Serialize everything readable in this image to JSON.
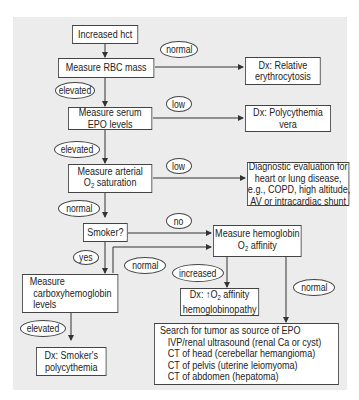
{
  "diagram": {
    "type": "flowchart",
    "nodes": {
      "start": {
        "lines": [
          "Increased hct"
        ]
      },
      "rbc_mass": {
        "lines": [
          "Measure RBC mass"
        ]
      },
      "relative": {
        "lines": [
          "Dx: Relative",
          "erythrocytosis"
        ]
      },
      "epo": {
        "lines": [
          "Measure serum",
          "EPO levels"
        ]
      },
      "pv": {
        "lines": [
          "Dx: Polycythemia",
          "vera"
        ]
      },
      "o2sat": {
        "lines": [
          "Measure arterial",
          "O2 saturation"
        ]
      },
      "diag_eval": {
        "lines": [
          "Diagnostic evaluation for",
          "heart or lung disease,",
          "e.g., COPD, high altitude,",
          "AV or intracardiac shunt"
        ]
      },
      "smoker": {
        "lines": [
          "Smoker?"
        ]
      },
      "hb_affinity": {
        "lines": [
          "Measure hemoglobin",
          "O2 affinity"
        ]
      },
      "cohb": {
        "lines": [
          "Measure",
          "carboxyhemoglobin",
          "levels"
        ]
      },
      "hb_path": {
        "lines": [
          "Dx: ↑O2 affinity",
          "hemoglobinopathy"
        ]
      },
      "smokers_pc": {
        "lines": [
          "Dx: Smoker's",
          "polycythemia"
        ]
      },
      "tumor": {
        "lines": [
          "Search for tumor as source of EPO",
          "IVP/renal ultrasound (renal Ca or cyst)",
          "CT of head (cerebellar hemangioma)",
          "CT of pelvis (uterine leiomyoma)",
          "CT of abdomen (hepatoma)"
        ]
      }
    },
    "edge_labels": {
      "rbc_normal": "normal",
      "rbc_elevated": "elevated",
      "epo_low": "low",
      "epo_elevated": "elevated",
      "o2_low": "low",
      "o2_normal": "normal",
      "smoker_no": "no",
      "smoker_yes": "yes",
      "cohb_normal": "normal",
      "cohb_elevated": "elevated",
      "affinity_increased": "increased",
      "affinity_normal": "normal"
    },
    "edges": [
      {
        "from": "start",
        "to": "rbc_mass"
      },
      {
        "from": "rbc_mass",
        "to": "relative",
        "label": "normal"
      },
      {
        "from": "rbc_mass",
        "to": "epo",
        "label": "elevated"
      },
      {
        "from": "epo",
        "to": "pv",
        "label": "low"
      },
      {
        "from": "epo",
        "to": "o2sat",
        "label": "elevated"
      },
      {
        "from": "o2sat",
        "to": "diag_eval",
        "label": "low"
      },
      {
        "from": "o2sat",
        "to": "smoker",
        "label": "normal"
      },
      {
        "from": "smoker",
        "to": "hb_affinity",
        "label": "no"
      },
      {
        "from": "smoker",
        "to": "cohb",
        "label": "yes"
      },
      {
        "from": "cohb",
        "to": "hb_affinity",
        "label": "normal"
      },
      {
        "from": "cohb",
        "to": "smokers_pc",
        "label": "elevated"
      },
      {
        "from": "hb_affinity",
        "to": "hb_path",
        "label": "increased"
      },
      {
        "from": "hb_affinity",
        "to": "tumor",
        "label": "normal"
      }
    ]
  }
}
